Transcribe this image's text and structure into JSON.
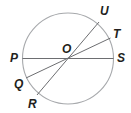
{
  "diagram": {
    "type": "circle-with-diameters",
    "circle": {
      "cx": 68,
      "cy": 58.5,
      "r": 45.5,
      "stroke": "#a7a9ac"
    },
    "line_color": "#6d6e71",
    "center": {
      "name": "O",
      "x": 68,
      "y": 58.5
    },
    "points": {
      "P": {
        "x": 22.5,
        "y": 58.5
      },
      "S": {
        "x": 113.5,
        "y": 58.5
      },
      "U": {
        "x": 99,
        "y": 25
      },
      "R": {
        "x": 37,
        "y": 92
      },
      "T": {
        "x": 110,
        "y": 41
      },
      "Q": {
        "x": 26,
        "y": 76
      }
    },
    "segments": [
      {
        "from": "P",
        "to": "S"
      },
      {
        "from": "U",
        "to": "R"
      },
      {
        "from": "T",
        "to": "Q"
      }
    ],
    "labels": {
      "O": "O",
      "P": "P",
      "Q": "Q",
      "R": "R",
      "S": "S",
      "T": "T",
      "U": "U"
    }
  }
}
